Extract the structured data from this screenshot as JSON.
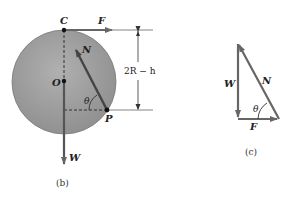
{
  "figure_b": {
    "caption": "(b)",
    "labels": {
      "C": "C",
      "F": "F",
      "N": "N",
      "O": "O",
      "theta": "θ",
      "P": "P",
      "W": "W",
      "dimension": "2R − h"
    }
  },
  "figure_c": {
    "caption": "(c)",
    "labels": {
      "W": "W",
      "N": "N",
      "theta": "θ",
      "F": "F"
    }
  },
  "colors": {
    "disk_fill": "#9e9e9e",
    "vector": "#555555",
    "line": "#666666"
  }
}
